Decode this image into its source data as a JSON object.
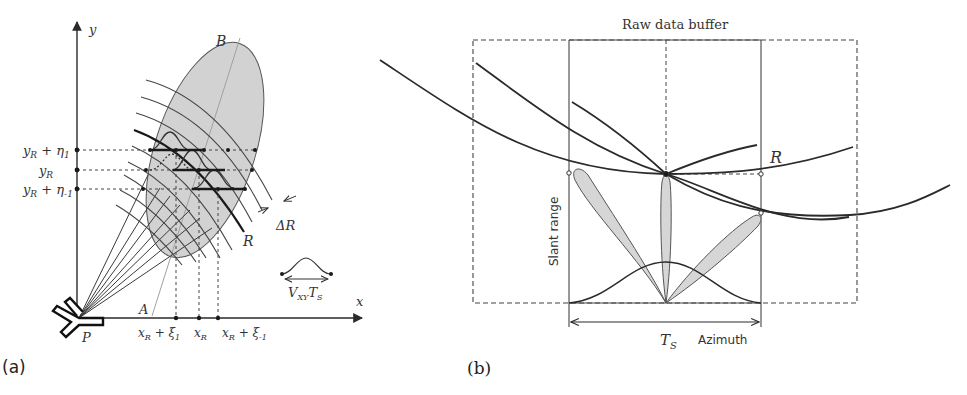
{
  "figure": {
    "panel_a": {
      "caption": "(a)",
      "axes": {
        "x_label": "x",
        "y_label": "y"
      },
      "y_ticks": [
        {
          "main": "y",
          "sub": "R",
          "suffix": " + η",
          "suffix_sub": "1"
        },
        {
          "main": "y",
          "sub": "R",
          "suffix": "",
          "suffix_sub": ""
        },
        {
          "main": "y",
          "sub": "R",
          "suffix": " + η",
          "suffix_sub": "-1"
        }
      ],
      "x_ticks": [
        {
          "main": "x",
          "sub": "R",
          "suffix": " + ξ",
          "suffix_sub": "1"
        },
        {
          "main": "x",
          "sub": "R",
          "suffix": "",
          "suffix_sub": ""
        },
        {
          "main": "x",
          "sub": "R",
          "suffix": " + ξ",
          "suffix_sub": "-1"
        }
      ],
      "labels": {
        "point_b": "B",
        "point_a": "A",
        "platform": "P",
        "range": "R",
        "range_resolution": "ΔR",
        "motion_main": "V",
        "motion_sub": "XY",
        "motion_t": "T",
        "motion_t_sub": "S"
      },
      "icons": [
        "antenna-icon"
      ]
    },
    "panel_b": {
      "caption": "(b)",
      "title": "Raw data buffer",
      "y_axis_label": "Slant range",
      "x_axis_label": "Azimuth",
      "interval_label_main": "T",
      "interval_label_sub": "S",
      "range_label": "R"
    },
    "colors": {
      "line": "#2a2a2a",
      "beam_fill": "#d6d6d6",
      "footprint_fill": "#d0d0d0",
      "text": "#333333",
      "light_line": "#9a9a9a"
    }
  }
}
